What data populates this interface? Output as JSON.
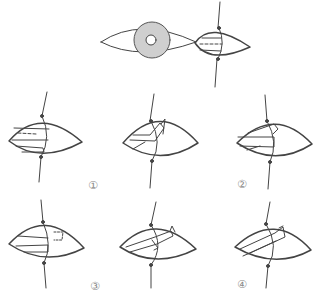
{
  "diagram": {
    "type": "surgical-illustration",
    "overview": {
      "description": "eye with iris and pupil, enlarged lens-shaped detail view with dashed incision line"
    },
    "colors": {
      "line": "#444444",
      "iris": "#cfcfcf",
      "label": "#8a8a8a"
    },
    "steps": [
      {
        "id": 1,
        "label": "①"
      },
      {
        "id": 2,
        "label": "②"
      },
      {
        "id": 3,
        "label": "③"
      },
      {
        "id": 4,
        "label": "④"
      }
    ]
  }
}
